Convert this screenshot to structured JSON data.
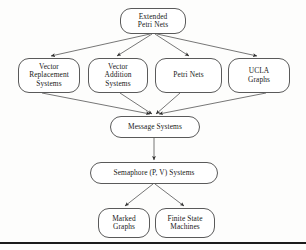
{
  "diagram": {
    "type": "hierarchy-flow-diagram",
    "edge_color": "#4a4a4a",
    "node_border_color": "#5a5a5a",
    "node_fill_color": "#ffffff",
    "background_color": "#fdfdfc",
    "baseline_rule_color": "#1c1c1c",
    "nodes": [
      {
        "id": "extended-petri-nets",
        "lines": [
          "Extended",
          "Petri Nets"
        ]
      },
      {
        "id": "vector-replacement-systems",
        "lines": [
          "Vector",
          "Replacement",
          "Systems"
        ]
      },
      {
        "id": "vector-addition-systems",
        "lines": [
          "Vector",
          "Addition",
          "Systems"
        ]
      },
      {
        "id": "petri-nets",
        "lines": [
          "Petri Nets"
        ]
      },
      {
        "id": "ucla-graphs",
        "lines": [
          "UCLA",
          "Graphs"
        ]
      },
      {
        "id": "message-systems",
        "lines": [
          "Message Systems"
        ]
      },
      {
        "id": "semaphore-systems",
        "lines": [
          "Semaphore (P, V) Systems"
        ]
      },
      {
        "id": "marked-graphs",
        "lines": [
          "Marked",
          "Graphs"
        ]
      },
      {
        "id": "finite-state-machines",
        "lines": [
          "Finite State",
          "Machines"
        ]
      }
    ],
    "edges": [
      {
        "from": "extended-petri-nets",
        "to": "vector-replacement-systems"
      },
      {
        "from": "extended-petri-nets",
        "to": "vector-addition-systems"
      },
      {
        "from": "extended-petri-nets",
        "to": "petri-nets"
      },
      {
        "from": "extended-petri-nets",
        "to": "ucla-graphs"
      },
      {
        "from": "vector-replacement-systems",
        "to": "message-systems"
      },
      {
        "from": "vector-addition-systems",
        "to": "message-systems"
      },
      {
        "from": "petri-nets",
        "to": "message-systems"
      },
      {
        "from": "ucla-graphs",
        "to": "message-systems"
      },
      {
        "from": "message-systems",
        "to": "semaphore-systems"
      },
      {
        "from": "semaphore-systems",
        "to": "marked-graphs"
      },
      {
        "from": "semaphore-systems",
        "to": "finite-state-machines"
      }
    ]
  },
  "labels": {
    "extended_l1": "Extended",
    "extended_l2": "Petri Nets",
    "vrs_l1": "Vector",
    "vrs_l2": "Replacement",
    "vrs_l3": "Systems",
    "vas_l1": "Vector",
    "vas_l2": "Addition",
    "vas_l3": "Systems",
    "petri_l1": "Petri Nets",
    "ucla_l1": "UCLA",
    "ucla_l2": "Graphs",
    "message_l1": "Message Systems",
    "semaphore_l1": "Semaphore (P, V) Systems",
    "marked_l1": "Marked",
    "marked_l2": "Graphs",
    "finite_l1": "Finite State",
    "finite_l2": "Machines"
  }
}
